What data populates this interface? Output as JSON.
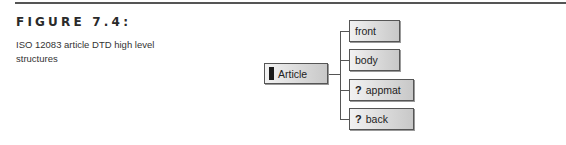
{
  "figure": {
    "label": "FIGURE 7.4:",
    "caption": "ISO 12083 article DTD high level structures"
  },
  "diagram": {
    "root": {
      "label": "Article",
      "marker": "filled-bar"
    },
    "children": [
      {
        "label": "front",
        "optional": false,
        "marker": ""
      },
      {
        "label": "body",
        "optional": false,
        "marker": ""
      },
      {
        "label": "appmat",
        "optional": true,
        "marker": "?"
      },
      {
        "label": "back",
        "optional": true,
        "marker": "?"
      }
    ]
  }
}
